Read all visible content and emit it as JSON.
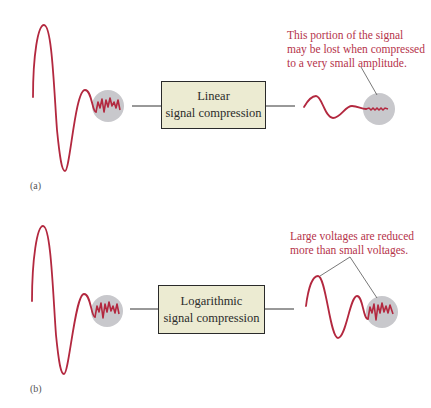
{
  "panels": [
    {
      "label": "(a)",
      "box": {
        "line1": "Linear",
        "line2": "signal compression"
      },
      "annotation": [
        "This portion of the signal",
        "may be lost when compressed",
        "to a very small amplitude."
      ]
    },
    {
      "label": "(b)",
      "box": {
        "line1": "Logarithmic",
        "line2": "signal compression"
      },
      "annotation": [
        "Large voltages are reduced",
        "more than small voltages."
      ]
    }
  ],
  "colors": {
    "signal": "#b3283f",
    "highlight_circle": "#c8c8cc",
    "box_fill": "#ecebd2",
    "annotation_text": "#b5334a",
    "connector": "#333333"
  }
}
